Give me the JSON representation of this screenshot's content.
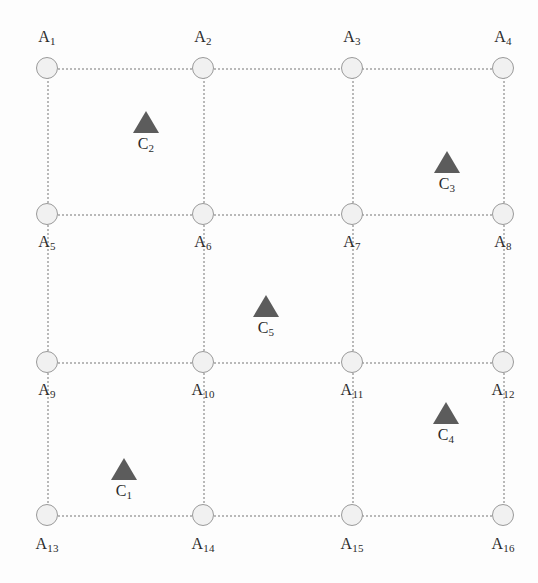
{
  "diagram": {
    "background_color": "#fdfdfd",
    "node_fill_color": "#f1f1f1",
    "node_stroke_color": "#9a9a9a",
    "edge_color": "#b9b9b9",
    "triangle_color": "#5c5c5c",
    "label_color": "#2b2b2b",
    "columns_x": [
      47,
      203,
      352,
      503
    ],
    "rows_y": [
      68,
      214,
      362,
      515
    ],
    "nodes": [
      {
        "id": "A1",
        "base": "A",
        "sub": "1",
        "x": 47,
        "y": 68,
        "label_x": 47,
        "label_y": 28,
        "label_position": "above"
      },
      {
        "id": "A2",
        "base": "A",
        "sub": "2",
        "x": 203,
        "y": 68,
        "label_x": 203,
        "label_y": 28,
        "label_position": "above"
      },
      {
        "id": "A3",
        "base": "A",
        "sub": "3",
        "x": 352,
        "y": 68,
        "label_x": 352,
        "label_y": 28,
        "label_position": "above"
      },
      {
        "id": "A4",
        "base": "A",
        "sub": "4",
        "x": 503,
        "y": 68,
        "label_x": 503,
        "label_y": 28,
        "label_position": "above"
      },
      {
        "id": "A5",
        "base": "A",
        "sub": "5",
        "x": 47,
        "y": 214,
        "label_x": 47,
        "label_y": 233,
        "label_position": "below"
      },
      {
        "id": "A6",
        "base": "A",
        "sub": "6",
        "x": 203,
        "y": 214,
        "label_x": 203,
        "label_y": 233,
        "label_position": "below"
      },
      {
        "id": "A7",
        "base": "A",
        "sub": "7",
        "x": 352,
        "y": 214,
        "label_x": 352,
        "label_y": 233,
        "label_position": "below"
      },
      {
        "id": "A8",
        "base": "A",
        "sub": "8",
        "x": 503,
        "y": 214,
        "label_x": 503,
        "label_y": 233,
        "label_position": "below"
      },
      {
        "id": "A9",
        "base": "A",
        "sub": "9",
        "x": 47,
        "y": 362,
        "label_x": 47,
        "label_y": 381,
        "label_position": "below"
      },
      {
        "id": "A10",
        "base": "A",
        "sub": "10",
        "x": 203,
        "y": 362,
        "label_x": 203,
        "label_y": 381,
        "label_position": "below"
      },
      {
        "id": "A11",
        "base": "A",
        "sub": "11",
        "x": 352,
        "y": 362,
        "label_x": 352,
        "label_y": 381,
        "label_position": "below"
      },
      {
        "id": "A12",
        "base": "A",
        "sub": "12",
        "x": 503,
        "y": 362,
        "label_x": 503,
        "label_y": 381,
        "label_position": "below"
      },
      {
        "id": "A13",
        "base": "A",
        "sub": "13",
        "x": 47,
        "y": 515,
        "label_x": 47,
        "label_y": 535,
        "label_position": "below"
      },
      {
        "id": "A14",
        "base": "A",
        "sub": "14",
        "x": 203,
        "y": 515,
        "label_x": 203,
        "label_y": 535,
        "label_position": "below"
      },
      {
        "id": "A15",
        "base": "A",
        "sub": "15",
        "x": 352,
        "y": 515,
        "label_x": 352,
        "label_y": 535,
        "label_position": "below"
      },
      {
        "id": "A16",
        "base": "A",
        "sub": "16",
        "x": 503,
        "y": 515,
        "label_x": 503,
        "label_y": 535,
        "label_position": "below"
      }
    ],
    "markers": [
      {
        "id": "C1",
        "base": "C",
        "sub": "1",
        "x": 124,
        "y": 458
      },
      {
        "id": "C2",
        "base": "C",
        "sub": "2",
        "x": 146,
        "y": 111
      },
      {
        "id": "C3",
        "base": "C",
        "sub": "3",
        "x": 447,
        "y": 151
      },
      {
        "id": "C4",
        "base": "C",
        "sub": "4",
        "x": 446,
        "y": 402
      },
      {
        "id": "C5",
        "base": "C",
        "sub": "5",
        "x": 266,
        "y": 295
      }
    ],
    "horizontal_edges": [
      {
        "y": 68,
        "x1": 47,
        "x2": 503
      },
      {
        "y": 214,
        "x1": 47,
        "x2": 503
      },
      {
        "y": 362,
        "x1": 47,
        "x2": 503
      },
      {
        "y": 515,
        "x1": 47,
        "x2": 503
      }
    ],
    "vertical_edges": [
      {
        "x": 47,
        "y1": 68,
        "y2": 515
      },
      {
        "x": 203,
        "y1": 68,
        "y2": 515
      },
      {
        "x": 352,
        "y1": 68,
        "y2": 515
      },
      {
        "x": 503,
        "y1": 68,
        "y2": 515
      }
    ]
  }
}
